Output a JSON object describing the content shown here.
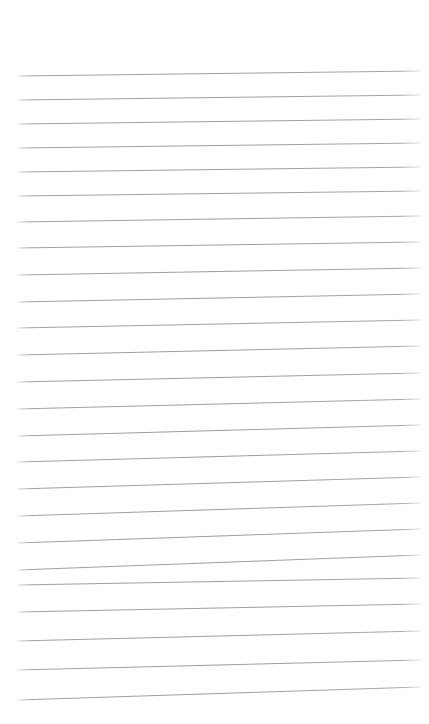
{
  "page": {
    "kind": "lined-paper",
    "width": 429,
    "height": 724,
    "background_color": "#ffffff",
    "top_margin": 70,
    "content_text": ""
  },
  "rules": {
    "line_color": "#9c9ca0",
    "line_width": 1,
    "count": 25,
    "x_start": 18,
    "x_end": 420,
    "lines": [
      {
        "index": 1,
        "y_left": 76,
        "y_right": 71
      },
      {
        "index": 2,
        "y_left": 100,
        "y_right": 95
      },
      {
        "index": 3,
        "y_left": 124,
        "y_right": 119
      },
      {
        "index": 4,
        "y_left": 148,
        "y_right": 143
      },
      {
        "index": 5,
        "y_left": 172,
        "y_right": 167
      },
      {
        "index": 6,
        "y_left": 196,
        "y_right": 191
      },
      {
        "index": 7,
        "y_left": 222,
        "y_right": 216
      },
      {
        "index": 8,
        "y_left": 248,
        "y_right": 242
      },
      {
        "index": 9,
        "y_left": 275,
        "y_right": 268
      },
      {
        "index": 10,
        "y_left": 302,
        "y_right": 294
      },
      {
        "index": 11,
        "y_left": 328,
        "y_right": 320
      },
      {
        "index": 12,
        "y_left": 355,
        "y_right": 346
      },
      {
        "index": 13,
        "y_left": 382,
        "y_right": 373
      },
      {
        "index": 14,
        "y_left": 409,
        "y_right": 399
      },
      {
        "index": 15,
        "y_left": 436,
        "y_right": 425
      },
      {
        "index": 16,
        "y_left": 462,
        "y_right": 451
      },
      {
        "index": 17,
        "y_left": 489,
        "y_right": 477
      },
      {
        "index": 18,
        "y_left": 516,
        "y_right": 503
      },
      {
        "index": 19,
        "y_left": 543,
        "y_right": 529
      },
      {
        "index": 20,
        "y_left": 570,
        "y_right": 555
      },
      {
        "index": 21,
        "y_left": 585,
        "y_right": 578
      },
      {
        "index": 22,
        "y_left": 612,
        "y_right": 604
      },
      {
        "index": 23,
        "y_left": 641,
        "y_right": 631
      },
      {
        "index": 24,
        "y_left": 670,
        "y_right": 660
      },
      {
        "index": 25,
        "y_left": 700,
        "y_right": 687
      }
    ]
  }
}
